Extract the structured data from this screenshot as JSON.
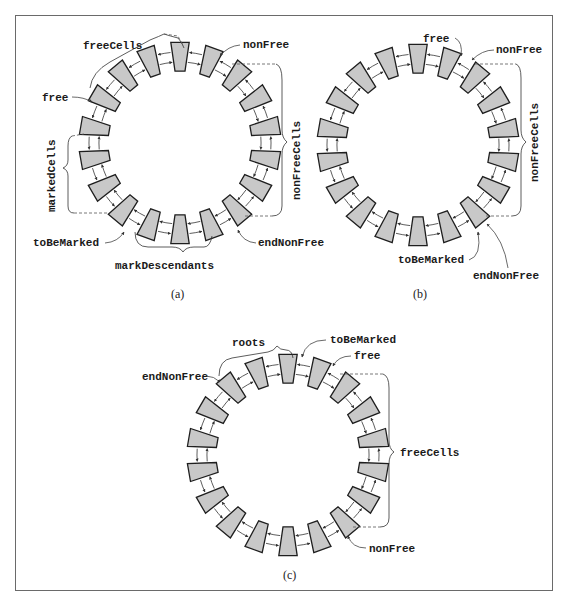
{
  "figure": {
    "panels": [
      {
        "id": "a",
        "caption": "(a)",
        "center": [
          180,
          143
        ],
        "cell_count": 18,
        "labels": {
          "freeCells": "freeCells",
          "free": "free",
          "nonFree": "nonFree",
          "nonFreeCells": "nonFreeCells",
          "markedCells": "markedCells",
          "toBeMarked": "toBeMarked",
          "markDescendants": "markDescendants",
          "endNonFree": "endNonFree"
        }
      },
      {
        "id": "b",
        "caption": "(b)",
        "center": [
          418,
          145
        ],
        "cell_count": 18,
        "labels": {
          "free": "free",
          "nonFree": "nonFree",
          "nonFreeCells": "nonFreeCells",
          "toBeMarked": "toBeMarked",
          "endNonFree": "endNonFree"
        }
      },
      {
        "id": "c",
        "caption": "(c)",
        "center": [
          288,
          455
        ],
        "cell_count": 18,
        "labels": {
          "roots": "roots",
          "toBeMarked": "toBeMarked",
          "free": "free",
          "endNonFree": "endNonFree",
          "freeCells": "freeCells",
          "nonFree": "nonFree"
        }
      }
    ],
    "colors": {
      "cell_fill": "#c8c8c8",
      "cell_stroke": "#1e1e1e",
      "frame": "#6a6a6a"
    }
  }
}
